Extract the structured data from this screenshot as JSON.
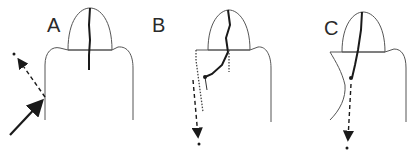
{
  "figure": {
    "panels": [
      {
        "label": "A",
        "description": "tooth with vertical crack confined to crown; external oblique force arrow striking root surface, dashed reflection arrow"
      },
      {
        "label": "B",
        "description": "tooth with crack running from crown obliquely into root; dotted outline of fragment; dashed downward arrow"
      },
      {
        "label": "C",
        "description": "tooth with crack through crown ending at root point; dashed downward arrow; concave left root outline"
      }
    ],
    "colors": {
      "stroke": "#555555",
      "crack": "#1a1a1a",
      "background": "#ffffff"
    }
  }
}
